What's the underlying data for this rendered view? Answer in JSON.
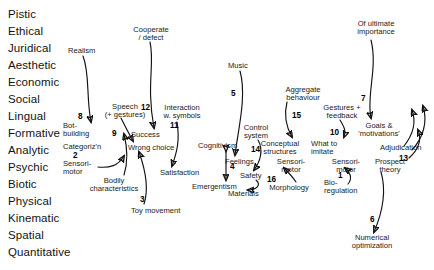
{
  "figure": {
    "ink_color": "#121212",
    "background": "#ffffff"
  },
  "aspects": {
    "label": "Modal aspects column",
    "items": [
      {
        "name": "Pistic",
        "x": 8,
        "y": 8
      },
      {
        "name": "Ethical",
        "x": 8,
        "y": 25
      },
      {
        "name": "Juridical",
        "x": 8,
        "y": 42
      },
      {
        "name": "Aesthetic",
        "x": 8,
        "y": 59
      },
      {
        "name": "Economic",
        "x": 8,
        "y": 76
      },
      {
        "name": "Social",
        "x": 8,
        "y": 93
      },
      {
        "name": "Lingual",
        "x": 8,
        "y": 110
      },
      {
        "name": "Formative",
        "x": 8,
        "y": 127
      },
      {
        "name": "Analytic",
        "x": 8,
        "y": 144
      },
      {
        "name": "Psychic",
        "x": 8,
        "y": 161
      },
      {
        "name": "Biotic",
        "x": 8,
        "y": 178
      },
      {
        "name": "Physical",
        "x": 8,
        "y": 195
      },
      {
        "name": "Kinematic",
        "x": 8,
        "y": 212
      },
      {
        "name": "Spatial",
        "x": 8,
        "y": 229
      },
      {
        "name": "Quantitative",
        "x": 8,
        "y": 246
      }
    ]
  },
  "nodes": [
    {
      "id": "realism",
      "text": "Realism",
      "x": 68,
      "y": 47,
      "w": 40,
      "align": "left"
    },
    {
      "id": "cooperate",
      "text": "Cooperate\n/ defect",
      "x": 125,
      "y": 26,
      "w": 52,
      "align": "center"
    },
    {
      "id": "music",
      "text": "Music",
      "x": 228,
      "y": 62,
      "w": 30,
      "align": "left"
    },
    {
      "id": "of-ultimate",
      "text": "Of ultimate\nimportance",
      "x": 349,
      "y": 20,
      "w": 54,
      "align": "center"
    },
    {
      "id": "aggregate",
      "text": "Aggregate\nbehaviour",
      "x": 279,
      "y": 86,
      "w": 48,
      "align": "center"
    },
    {
      "id": "speech",
      "text": "Speech\n(+ gestures)",
      "x": 97,
      "y": 103,
      "w": 56,
      "align": "center"
    },
    {
      "id": "interaction",
      "text": "Interaction\nw. symbols",
      "x": 158,
      "y": 104,
      "w": 48,
      "align": "center"
    },
    {
      "id": "gestures-fb",
      "text": "Gestures +\nfeedback",
      "x": 317,
      "y": 104,
      "w": 50,
      "align": "center"
    },
    {
      "id": "bot-building",
      "text": "Bot-\nbuilding",
      "x": 63,
      "y": 122,
      "w": 32,
      "align": "left"
    },
    {
      "id": "success",
      "text": "Success",
      "x": 131,
      "y": 131,
      "w": 38,
      "align": "left"
    },
    {
      "id": "control-system",
      "text": "Control\nsystem",
      "x": 238,
      "y": 124,
      "w": 36,
      "align": "center"
    },
    {
      "id": "goals",
      "text": "Goals &\n'motivations'",
      "x": 353,
      "y": 122,
      "w": 52,
      "align": "center"
    },
    {
      "id": "categoriz",
      "text": "Categoriz'n",
      "x": 63,
      "y": 143,
      "w": 48,
      "align": "left"
    },
    {
      "id": "wrong-choice",
      "text": "Wrong choice",
      "x": 128,
      "y": 144,
      "w": 58,
      "align": "left"
    },
    {
      "id": "cognitivism",
      "text": "Cognitivism",
      "x": 198,
      "y": 142,
      "w": 50,
      "align": "left"
    },
    {
      "id": "conceptual",
      "text": "Conceptual\nstructures",
      "x": 255,
      "y": 140,
      "w": 50,
      "align": "center"
    },
    {
      "id": "what-to-imitate",
      "text": "What to\nimitate",
      "x": 311,
      "y": 140,
      "w": 38,
      "align": "left"
    },
    {
      "id": "adjudication",
      "text": "Adjudication",
      "x": 380,
      "y": 144,
      "w": 52,
      "align": "left"
    },
    {
      "id": "sensorimotor-2",
      "text": "Sensori-\nmotor",
      "x": 63,
      "y": 160,
      "w": 34,
      "align": "left"
    },
    {
      "id": "feelings",
      "text": "Feelings",
      "x": 225,
      "y": 158,
      "w": 36,
      "align": "left"
    },
    {
      "id": "sensorimotor-16",
      "text": "Sensori-\nmotor",
      "x": 274,
      "y": 158,
      "w": 34,
      "align": "center"
    },
    {
      "id": "sensorimotor-1",
      "text": "Sensori-\nmotor",
      "x": 329,
      "y": 158,
      "w": 34,
      "align": "center"
    },
    {
      "id": "prospect",
      "text": "Prospect\ntheory",
      "x": 371,
      "y": 158,
      "w": 38,
      "align": "center"
    },
    {
      "id": "satisfaction",
      "text": "Satisfaction",
      "x": 160,
      "y": 169,
      "w": 50,
      "align": "left"
    },
    {
      "id": "safety",
      "text": "Safety",
      "x": 240,
      "y": 172,
      "w": 28,
      "align": "left"
    },
    {
      "id": "bodily",
      "text": "Bodily\ncharacteristics",
      "x": 83,
      "y": 177,
      "w": 62,
      "align": "center"
    },
    {
      "id": "emergentism",
      "text": "Emergentism",
      "x": 192,
      "y": 183,
      "w": 58,
      "align": "left"
    },
    {
      "id": "morphology",
      "text": "Morphology",
      "x": 264,
      "y": 184,
      "w": 50,
      "align": "center"
    },
    {
      "id": "bio-regulation",
      "text": "Bio-\nregulation",
      "x": 324,
      "y": 179,
      "w": 44,
      "align": "left"
    },
    {
      "id": "materials",
      "text": "Materials",
      "x": 228,
      "y": 190,
      "w": 40,
      "align": "left"
    },
    {
      "id": "toy-movement",
      "text": "Toy movement",
      "x": 131,
      "y": 207,
      "w": 64,
      "align": "left"
    },
    {
      "id": "numerical",
      "text": "Numerical\noptimization",
      "x": 344,
      "y": 234,
      "w": 56,
      "align": "center"
    }
  ],
  "link_numbers": [
    {
      "n": "8",
      "x": 78,
      "y": 113
    },
    {
      "n": "9",
      "x": 112,
      "y": 130
    },
    {
      "n": "12",
      "x": 141,
      "y": 104
    },
    {
      "n": "11",
      "x": 170,
      "y": 122
    },
    {
      "n": "2",
      "x": 73,
      "y": 152
    },
    {
      "n": "3",
      "x": 140,
      "y": 196
    },
    {
      "n": "4",
      "x": 230,
      "y": 168
    },
    {
      "n": "5",
      "x": 231,
      "y": 90
    },
    {
      "n": "14",
      "x": 251,
      "y": 146
    },
    {
      "n": "15",
      "x": 292,
      "y": 112
    },
    {
      "n": "16",
      "x": 267,
      "y": 176
    },
    {
      "n": "10",
      "x": 330,
      "y": 129
    },
    {
      "n": "1",
      "x": 338,
      "y": 177
    },
    {
      "n": "7",
      "x": 361,
      "y": 95
    },
    {
      "n": "13",
      "x": 399,
      "y": 155
    },
    {
      "n": "6",
      "x": 370,
      "y": 216
    }
  ],
  "arrows": {
    "label": "Curved connector arrows between concept labels",
    "count": 17
  }
}
